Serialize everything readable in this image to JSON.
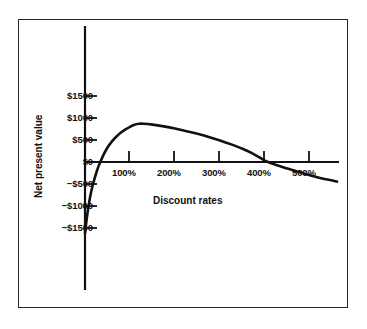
{
  "chart_data": {
    "type": "line",
    "title": "",
    "xlabel": "Discount rates",
    "ylabel": "Net present value",
    "xlim": [
      -15,
      570
    ],
    "ylim": [
      -1750,
      1900
    ],
    "grid": false,
    "legend": null,
    "xticks": [
      {
        "value": 100,
        "label": "100%"
      },
      {
        "value": 200,
        "label": "200%"
      },
      {
        "value": 300,
        "label": "300%"
      },
      {
        "value": 400,
        "label": "400%"
      },
      {
        "value": 500,
        "label": "500%"
      }
    ],
    "yticks": [
      {
        "value": 1500,
        "label": "$1500"
      },
      {
        "value": 1000,
        "label": "$1000"
      },
      {
        "value": 500,
        "label": "$500"
      },
      {
        "value": 0,
        "label": "$0"
      },
      {
        "value": -500,
        "label": "−$500"
      },
      {
        "value": -1000,
        "label": "−$1000"
      },
      {
        "value": -1500,
        "label": "−$1500"
      }
    ],
    "series": [
      {
        "name": "Net present value",
        "x": [
          0,
          5,
          10,
          15,
          20,
          25,
          30,
          40,
          50,
          60,
          70,
          80,
          90,
          100,
          110,
          120,
          130,
          150,
          175,
          200,
          225,
          250,
          275,
          300,
          325,
          350,
          375,
          395,
          400,
          425,
          450,
          475,
          500,
          525,
          550,
          560
        ],
        "y": [
          -1620,
          -1200,
          -870,
          -620,
          -420,
          -250,
          -100,
          140,
          330,
          470,
          580,
          670,
          740,
          800,
          845,
          868,
          870,
          850,
          810,
          760,
          700,
          640,
          570,
          490,
          400,
          300,
          180,
          60,
          30,
          -70,
          -150,
          -230,
          -300,
          -370,
          -420,
          -445
        ]
      }
    ],
    "annotations": {
      "y_axis_color": "#111111",
      "curve_color": "#111111",
      "frame_color": "#262626",
      "background": "#ffffff"
    }
  }
}
